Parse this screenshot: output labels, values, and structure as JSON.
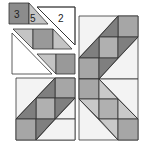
{
  "diagram": {
    "type": "quilt-block-assembly",
    "labels": [
      {
        "id": "piece-3",
        "text": "3"
      },
      {
        "id": "piece-5",
        "text": "5"
      },
      {
        "id": "piece-2",
        "text": "2"
      }
    ],
    "colors": {
      "dark": "#7f7f7f",
      "medium": "#a6a6a6",
      "light": "#c9c9c9",
      "background": "#f3f3f3",
      "outline": "#333333"
    }
  }
}
